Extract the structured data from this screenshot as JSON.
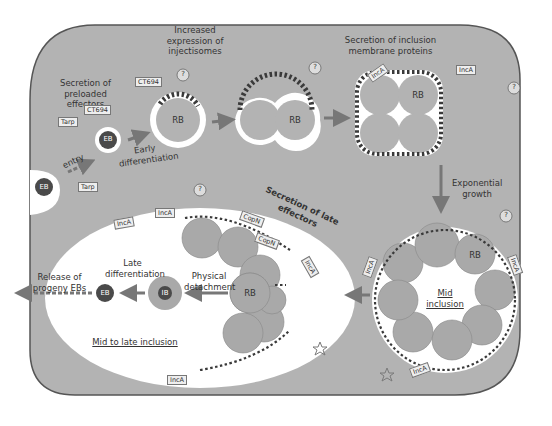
{
  "colors": {
    "cell": "#b3b3b3",
    "cell_border": "#555555",
    "inclusion": "#ffffff",
    "rb": "#a9a9a9",
    "eb": "#4a4a4a",
    "arrow": "#777777",
    "injectisome": "#3a3a3a"
  },
  "labels": {
    "increased_injectisomes": "Increased expression of injectisomes",
    "secretion_preloaded": "Secretion of preloaded effectors",
    "secretion_inc": "Secretion of inclusion membrane proteins",
    "entry": "entry",
    "early_diff": "Early differentiation",
    "exponential": "Exponential growth",
    "secretion_late": "Secretion of late effectors",
    "late_diff": "Late differentiation",
    "physical_detach": "Physical detachment",
    "release": "Release of progeny EBs",
    "mid_inclusion": "Mid inclusion",
    "mid_late_inclusion": "Mid to late inclusion"
  },
  "bodies": {
    "eb": "EB",
    "rb": "RB",
    "ib": "IB",
    "unknown": "?"
  },
  "effectors": {
    "tarp": "Tarp",
    "ct694": "CT694",
    "inca": "IncA",
    "copn": "CopN"
  }
}
